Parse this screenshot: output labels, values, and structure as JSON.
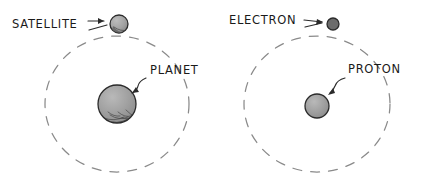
{
  "figure": {
    "background_color": "#ffffff",
    "style": "hand-drawn line diagram",
    "panels": [
      {
        "id": "left-panel",
        "name": "planetary-system",
        "orbit": {
          "name": "satellite-orbit",
          "center_x": 117,
          "center_y": 104,
          "radius_x": 72,
          "radius_y": 68,
          "stroke_color": "#8a8a8a",
          "dash_pattern": "9 9"
        },
        "center_body": {
          "name": "planet",
          "label": "PLANET",
          "cx": 117,
          "cy": 104,
          "r": 19,
          "fill_color": "#9c9c9c",
          "outline_color": "#2b2b2b",
          "shaded": true
        },
        "orbiting_body": {
          "name": "satellite",
          "label": "SATELLITE",
          "cx": 119,
          "cy": 24,
          "r": 9,
          "fill_color": "#9c9c9c",
          "outline_color": "#2b2b2b",
          "shaded": true
        },
        "labels": [
          {
            "name": "satellite-label",
            "text": "SATELLITE",
            "x": 12,
            "y": 28
          },
          {
            "name": "planet-label",
            "text": "PLANET",
            "x": 150,
            "y": 74
          }
        ]
      },
      {
        "id": "right-panel",
        "name": "atomic-system",
        "orbit": {
          "name": "electron-orbit",
          "center_x": 317,
          "center_y": 104,
          "radius_x": 73,
          "radius_y": 68,
          "stroke_color": "#8a8a8a",
          "dash_pattern": "9 9"
        },
        "center_body": {
          "name": "proton",
          "label": "PROTON",
          "cx": 317,
          "cy": 106,
          "r": 12,
          "fill_color": "#9c9c9c",
          "outline_color": "#2b2b2b",
          "shaded": false
        },
        "orbiting_body": {
          "name": "electron",
          "label": "ELECTRON",
          "cx": 333,
          "cy": 24,
          "r": 6,
          "fill_color": "#6b6b6b",
          "outline_color": "#2b2b2b",
          "shaded": false
        },
        "labels": [
          {
            "name": "electron-label",
            "text": "ELECTRON",
            "x": 229,
            "y": 24
          },
          {
            "name": "proton-label",
            "text": "PROTON",
            "x": 348,
            "y": 73
          }
        ]
      }
    ],
    "pointers": [
      {
        "name": "satellite-pointer",
        "from_label": "SATELLITE",
        "to_body": "satellite",
        "style": "straight-arrow"
      },
      {
        "name": "planet-pointer",
        "from_label": "PLANET",
        "to_body": "planet",
        "style": "curved-arrow"
      },
      {
        "name": "electron-pointer",
        "from_label": "ELECTRON",
        "to_body": "electron",
        "style": "straight-arrow"
      },
      {
        "name": "proton-pointer",
        "from_label": "PROTON",
        "to_body": "proton",
        "style": "curved-arrow"
      }
    ]
  }
}
